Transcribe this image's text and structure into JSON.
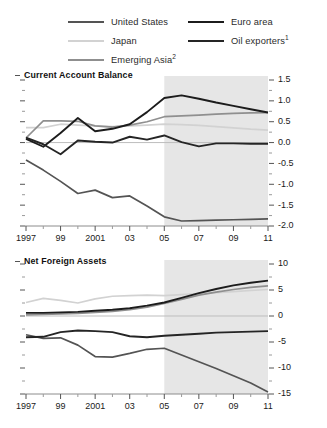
{
  "legend": {
    "entries": [
      {
        "label": "United States",
        "color": "#545454",
        "column": "left",
        "footnote": ""
      },
      {
        "label": "Japan",
        "color": "#d2d2d2",
        "column": "left",
        "footnote": ""
      },
      {
        "label": "Emerging Asia",
        "color": "#8f8f8f",
        "column": "left",
        "footnote": "2"
      },
      {
        "label": "Euro area",
        "color": "#1c1c1c",
        "column": "right",
        "footnote": ""
      },
      {
        "label": "Oil exporters",
        "color": "#252525",
        "column": "right",
        "footnote": "1"
      }
    ]
  },
  "chart_data": [
    {
      "type": "line",
      "title": "Current Account Balance",
      "xlabel": "",
      "ylabel": "",
      "xlim": [
        1997,
        2011
      ],
      "ylim": [
        -2.0,
        1.5
      ],
      "yticks": [
        1.5,
        1.0,
        0.5,
        0.0,
        -0.5,
        -1.0,
        -1.5,
        -2.0
      ],
      "ytick_labels": [
        "1.5",
        "1.0",
        "0.5",
        "0.0",
        "-0.5",
        "-1.0",
        "-1.5",
        "-2.0"
      ],
      "y_minor_step": 0.25,
      "xticks": [
        1997,
        1999,
        2001,
        2003,
        2005,
        2007,
        2009,
        2011
      ],
      "xtick_labels": [
        "1997",
        "99",
        "2001",
        "03",
        "05",
        "07",
        "09",
        "11"
      ],
      "grid": false,
      "legend_position": "top",
      "y_axis_side": "right",
      "zero_line": 0.0,
      "forecast_start": 2005,
      "forecast_shading": "#e6e6e6",
      "x": [
        1997,
        1998,
        1999,
        2000,
        2001,
        2002,
        2003,
        2004,
        2005,
        2006,
        2007,
        2008,
        2009,
        2010,
        2011
      ],
      "series": [
        {
          "name": "United States",
          "color": "#545454",
          "width": 1.7,
          "values": [
            -0.42,
            -0.66,
            -0.93,
            -1.22,
            -1.14,
            -1.32,
            -1.28,
            -1.52,
            -1.78,
            -1.88,
            -1.87,
            -1.86,
            -1.85,
            -1.84,
            -1.83
          ]
        },
        {
          "name": "Japan",
          "color": "#d2d2d2",
          "width": 1.7,
          "values": [
            0.36,
            0.36,
            0.44,
            0.42,
            0.4,
            0.38,
            0.4,
            0.42,
            0.44,
            0.43,
            0.41,
            0.38,
            0.35,
            0.32,
            0.3
          ]
        },
        {
          "name": "Emerging Asia",
          "color": "#8f8f8f",
          "width": 1.7,
          "values": [
            0.11,
            0.52,
            0.52,
            0.51,
            0.4,
            0.37,
            0.42,
            0.5,
            0.62,
            0.64,
            0.66,
            0.68,
            0.7,
            0.71,
            0.72
          ]
        },
        {
          "name": "Euro area",
          "color": "#1c1c1c",
          "width": 1.9,
          "values": [
            0.09,
            -0.1,
            0.23,
            0.59,
            0.27,
            0.33,
            0.44,
            0.73,
            1.07,
            1.13,
            1.05,
            0.96,
            0.88,
            0.8,
            0.72
          ]
        },
        {
          "name": "Oil exporters",
          "color": "#252525",
          "width": 1.9,
          "values": [
            0.12,
            -0.04,
            -0.28,
            0.05,
            0.02,
            0.0,
            0.14,
            0.07,
            0.17,
            0.01,
            -0.09,
            -0.02,
            -0.02,
            -0.03,
            -0.03
          ]
        }
      ]
    },
    {
      "type": "line",
      "title": "Net Foreign Assets",
      "xlabel": "",
      "ylabel": "",
      "xlim": [
        1997,
        2011
      ],
      "ylim": [
        -15,
        10
      ],
      "yticks": [
        10,
        5,
        0,
        -5,
        -10,
        -15
      ],
      "ytick_labels": [
        "10",
        "5",
        "0",
        "-5",
        "-10",
        "-15"
      ],
      "y_minor_step": 2.5,
      "xticks": [
        1997,
        1999,
        2001,
        2003,
        2005,
        2007,
        2009,
        2011
      ],
      "xtick_labels": [
        "1997",
        "99",
        "2001",
        "03",
        "05",
        "07",
        "09",
        "11"
      ],
      "grid": false,
      "legend_position": "top",
      "y_axis_side": "right",
      "zero_line": 0,
      "forecast_start": 2005,
      "forecast_shading": "#e6e6e6",
      "x": [
        1997,
        1998,
        1999,
        2000,
        2001,
        2002,
        2003,
        2004,
        2005,
        2006,
        2007,
        2008,
        2009,
        2010,
        2011
      ],
      "series": [
        {
          "name": "United States",
          "color": "#545454",
          "width": 1.7,
          "values": [
            -3.6,
            -4.3,
            -4.2,
            -5.6,
            -7.8,
            -7.9,
            -7.2,
            -6.4,
            -6.2,
            -7.5,
            -8.8,
            -10.1,
            -11.5,
            -12.9,
            -14.6
          ]
        },
        {
          "name": "Japan",
          "color": "#d2d2d2",
          "width": 1.7,
          "values": [
            2.6,
            3.4,
            3.0,
            2.5,
            3.3,
            3.8,
            3.9,
            4.0,
            3.9,
            4.1,
            4.3,
            4.5,
            4.7,
            4.9,
            5.1
          ]
        },
        {
          "name": "Emerging Asia",
          "color": "#8f8f8f",
          "width": 1.7,
          "values": [
            0.2,
            0.3,
            0.4,
            0.5,
            0.7,
            0.9,
            1.2,
            1.7,
            2.4,
            3.2,
            4.0,
            4.6,
            5.1,
            5.5,
            5.8
          ]
        },
        {
          "name": "Euro area",
          "color": "#1c1c1c",
          "width": 1.9,
          "values": [
            0.6,
            0.6,
            0.7,
            0.8,
            1.0,
            1.2,
            1.5,
            2.0,
            2.6,
            3.5,
            4.4,
            5.2,
            5.9,
            6.4,
            6.8
          ]
        },
        {
          "name": "Oil exporters",
          "color": "#252525",
          "width": 1.9,
          "values": [
            -4.1,
            -4.0,
            -3.1,
            -2.8,
            -2.9,
            -3.1,
            -3.9,
            -4.1,
            -3.8,
            -3.6,
            -3.4,
            -3.2,
            -3.1,
            -3.0,
            -2.9
          ]
        }
      ]
    }
  ]
}
